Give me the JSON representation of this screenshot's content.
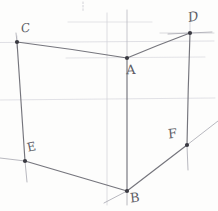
{
  "canvas": {
    "width": 218,
    "height": 211,
    "background_color": "#fdfdfc",
    "medium": "pencil sketch on paper"
  },
  "colors": {
    "edge_stroke": "#6a6a72",
    "construction_stroke": "#c9c9cf",
    "faint_stroke": "#dddde2",
    "vertex_dot": "#3a3a42",
    "label_text": "#5e5e66"
  },
  "vertices": [
    {
      "id": "A",
      "label": "A",
      "x": 127,
      "y": 58,
      "label_x": 126,
      "label_y": 63
    },
    {
      "id": "B",
      "label": "B",
      "x": 127,
      "y": 191,
      "label_x": 130,
      "label_y": 191
    },
    {
      "id": "C",
      "label": "C",
      "x": 17,
      "y": 42,
      "label_x": 21,
      "label_y": 22
    },
    {
      "id": "D",
      "label": "D",
      "x": 190,
      "y": 33,
      "label_x": 188,
      "label_y": 10
    },
    {
      "id": "E",
      "label": "E",
      "x": 25,
      "y": 161,
      "label_x": 27,
      "label_y": 141
    },
    {
      "id": "F",
      "label": "F",
      "x": 187,
      "y": 145,
      "label_x": 168,
      "label_y": 127
    }
  ],
  "edges": [
    {
      "name": "edge-C-A",
      "from": "C",
      "to": "A"
    },
    {
      "name": "edge-A-D",
      "from": "A",
      "to": "D"
    },
    {
      "name": "edge-C-E",
      "from": "C",
      "to": "E"
    },
    {
      "name": "edge-D-F",
      "from": "D",
      "to": "F"
    },
    {
      "name": "edge-A-B",
      "from": "A",
      "to": "B"
    },
    {
      "name": "edge-E-B",
      "from": "E",
      "to": "B"
    },
    {
      "name": "edge-B-F",
      "from": "B",
      "to": "F"
    }
  ],
  "construction_lines": {
    "horizontals": [
      22,
      33,
      42,
      58,
      99
    ],
    "verticals": [
      17,
      83,
      107,
      127,
      190
    ],
    "notes": "faint pencil guide lines and extensions past the vertices"
  }
}
